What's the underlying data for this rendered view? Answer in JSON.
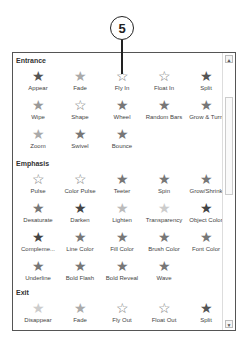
{
  "callout": {
    "number": "5"
  },
  "gallery": {
    "sections": [
      {
        "title": "Entrance",
        "items": [
          "Appear",
          "Fade",
          "Fly In",
          "Float In",
          "Split",
          "Wipe",
          "Shape",
          "Wheel",
          "Random Bars",
          "Grow & Turn",
          "Zoom",
          "Swivel",
          "Bounce"
        ]
      },
      {
        "title": "Emphasis",
        "items": [
          "Pulse",
          "Color Pulse",
          "Teeter",
          "Spin",
          "Grow/Shrink",
          "Desaturate",
          "Darken",
          "Lighten",
          "Transparency",
          "Object Color",
          "Compleme...",
          "Line Color",
          "Fill Color",
          "Brush Color",
          "Font Color",
          "Underline",
          "Bold Flash",
          "Bold Reveal",
          "Wave"
        ]
      },
      {
        "title": "Exit",
        "items": [
          "Disappear",
          "Fade",
          "Fly Out",
          "Float Out",
          "Split"
        ]
      }
    ]
  },
  "scrollbar": {
    "up": "▲",
    "down": "▼"
  },
  "icons": {
    "star": "★",
    "star_outline": "☆"
  }
}
